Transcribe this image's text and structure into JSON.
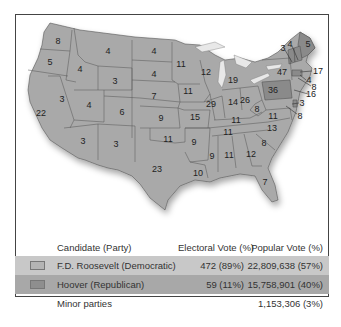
{
  "map": {
    "colors": {
      "democratic": "#a9a9a9",
      "republican": "#8a8a8a",
      "water": "#e8e8e8"
    },
    "state_labels": [
      {
        "id": "WA",
        "value": "8",
        "x": 58,
        "y": 41
      },
      {
        "id": "OR",
        "value": "5",
        "x": 50,
        "y": 62
      },
      {
        "id": "CA",
        "value": "22",
        "x": 41,
        "y": 113
      },
      {
        "id": "ID",
        "value": "4",
        "x": 80,
        "y": 69
      },
      {
        "id": "NV",
        "value": "3",
        "x": 62,
        "y": 99
      },
      {
        "id": "MT",
        "value": "4",
        "x": 108,
        "y": 51
      },
      {
        "id": "WY",
        "value": "3",
        "x": 115,
        "y": 81
      },
      {
        "id": "UT",
        "value": "4",
        "x": 89,
        "y": 105
      },
      {
        "id": "AZ",
        "value": "3",
        "x": 83,
        "y": 141
      },
      {
        "id": "CO",
        "value": "6",
        "x": 122,
        "y": 112
      },
      {
        "id": "NM",
        "value": "3",
        "x": 116,
        "y": 144
      },
      {
        "id": "ND",
        "value": "4",
        "x": 154,
        "y": 51
      },
      {
        "id": "SD",
        "value": "4",
        "x": 154,
        "y": 74
      },
      {
        "id": "NE",
        "value": "7",
        "x": 154,
        "y": 96
      },
      {
        "id": "KS",
        "value": "9",
        "x": 161,
        "y": 118
      },
      {
        "id": "OK",
        "value": "11",
        "x": 168,
        "y": 139
      },
      {
        "id": "TX",
        "value": "23",
        "x": 157,
        "y": 169
      },
      {
        "id": "MN",
        "value": "11",
        "x": 181,
        "y": 64
      },
      {
        "id": "IA",
        "value": "11",
        "x": 188,
        "y": 91
      },
      {
        "id": "MO",
        "value": "15",
        "x": 195,
        "y": 117
      },
      {
        "id": "AR",
        "value": "9",
        "x": 194,
        "y": 142
      },
      {
        "id": "LA",
        "value": "10",
        "x": 198,
        "y": 173
      },
      {
        "id": "WI",
        "value": "12",
        "x": 206,
        "y": 72
      },
      {
        "id": "IL",
        "value": "29",
        "x": 211,
        "y": 104
      },
      {
        "id": "MI",
        "value": "19",
        "x": 233,
        "y": 80
      },
      {
        "id": "IN",
        "value": "14",
        "x": 233,
        "y": 102
      },
      {
        "id": "OH",
        "value": "26",
        "x": 245,
        "y": 100
      },
      {
        "id": "KY",
        "value": "11",
        "x": 236,
        "y": 120
      },
      {
        "id": "TN",
        "value": "11",
        "x": 228,
        "y": 132
      },
      {
        "id": "MS",
        "value": "9",
        "x": 212,
        "y": 156
      },
      {
        "id": "AL",
        "value": "11",
        "x": 229,
        "y": 155
      },
      {
        "id": "GA",
        "value": "12",
        "x": 251,
        "y": 154
      },
      {
        "id": "FL",
        "value": "7",
        "x": 265,
        "y": 182
      },
      {
        "id": "SC",
        "value": "8",
        "x": 264,
        "y": 143
      },
      {
        "id": "NC",
        "value": "13",
        "x": 272,
        "y": 128
      },
      {
        "id": "VA",
        "value": "11",
        "x": 273,
        "y": 116
      },
      {
        "id": "WV",
        "value": "8",
        "x": 257,
        "y": 109
      },
      {
        "id": "PA",
        "value": "36",
        "x": 273,
        "y": 90
      },
      {
        "id": "NY",
        "value": "47",
        "x": 282,
        "y": 72
      },
      {
        "id": "ME",
        "value": "5",
        "x": 308,
        "y": 44
      },
      {
        "id": "VT",
        "value": "3",
        "x": 283,
        "y": 48
      },
      {
        "id": "NH",
        "value": "4",
        "x": 290,
        "y": 44
      },
      {
        "id": "MA",
        "value": "17",
        "x": 318,
        "y": 71
      },
      {
        "id": "RI",
        "value": "4",
        "x": 309,
        "y": 80
      },
      {
        "id": "CT",
        "value": "8",
        "x": 314,
        "y": 87
      },
      {
        "id": "NJ",
        "value": "16",
        "x": 311,
        "y": 94
      },
      {
        "id": "DE",
        "value": "3",
        "x": 302,
        "y": 103
      },
      {
        "id": "MD",
        "value": "8",
        "x": 300,
        "y": 116
      }
    ]
  },
  "legend": {
    "headers": {
      "candidate": "Candidate (Party)",
      "electoral": "Electoral Vote (%)",
      "popular": "Popular Vote (%)"
    },
    "rows": [
      {
        "candidate": "F.D. Roosevelt (Democratic)",
        "electoral": "472 (89%)",
        "popular": "22,809,638 (57%)"
      },
      {
        "candidate": "Hoover (Republican)",
        "electoral": "59 (11%)",
        "popular": "15,758,901 (40%)"
      },
      {
        "candidate": "Minor parties",
        "electoral": "",
        "popular": "1,153,306 (3%)"
      }
    ]
  }
}
